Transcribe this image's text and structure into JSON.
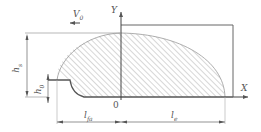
{
  "diagram": {
    "labels": {
      "velocity": "V",
      "velocity_sub": "0",
      "y_axis": "Y",
      "x_axis": "X",
      "origin": "0",
      "hs": "h",
      "hs_sub": "s",
      "h0": "h",
      "h0_sub": "0",
      "lfa": "l",
      "lfa_sub": "fa",
      "le": "l",
      "le_sub": "e"
    },
    "colors": {
      "stroke": "#555555",
      "hatch": "#b0b0b0",
      "dim": "#666666"
    }
  }
}
